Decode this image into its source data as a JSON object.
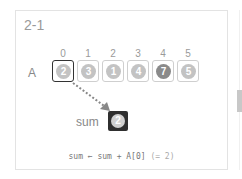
{
  "step_label": "2-1",
  "array": {
    "name": "A",
    "indices": [
      "0",
      "1",
      "2",
      "3",
      "4",
      "5"
    ],
    "values": [
      "2",
      "3",
      "1",
      "4",
      "7",
      "5"
    ],
    "active_index": 0
  },
  "sum": {
    "label": "sum",
    "value": "2"
  },
  "equation": {
    "code": "sum ← sum + A[0]",
    "note": "(= 2)"
  },
  "colors": {
    "active_border": "#333333",
    "sum_box": "#2f2f2f",
    "circle_light": "#c3c3c3",
    "circle_dark": "#8a8a8a",
    "arrow": "#888888"
  }
}
